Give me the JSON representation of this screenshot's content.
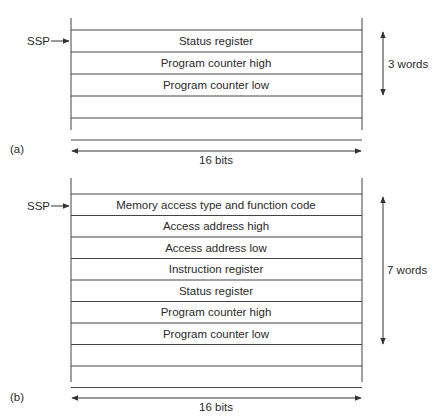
{
  "diagrams": [
    {
      "id": "a",
      "caption": "(a)",
      "pointer_label": "SSP",
      "rows": [
        "Status register",
        "Program counter high",
        "Program counter low",
        "",
        ""
      ],
      "span_label": "3 words",
      "width_label": "16 bits"
    },
    {
      "id": "b",
      "caption": "(b)",
      "pointer_label": "SSP",
      "rows": [
        "Memory access type and function code",
        "Access address high",
        "Access address low",
        "Instruction register",
        "Status register",
        "Program counter high",
        "Program counter low",
        "",
        ""
      ],
      "span_label": "7 words",
      "width_label": "16 bits"
    }
  ],
  "colors": {
    "line": "#444444",
    "text": "#2a2a2a"
  }
}
